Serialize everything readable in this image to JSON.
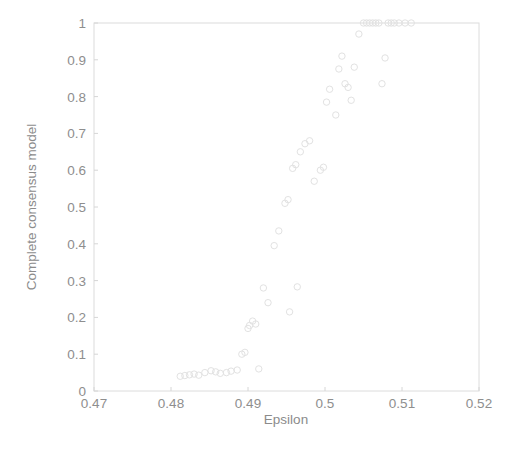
{
  "figure": {
    "background_color": "#ffffff",
    "axis_color": "#dcdcdc",
    "marker_color": "#e2e2e2",
    "text_color": "#8b8b8b"
  },
  "chart_data": {
    "type": "scatter",
    "title": "",
    "xlabel": "Epsilon",
    "ylabel": "Complete consensus model",
    "xlim": [
      0.47,
      0.52
    ],
    "ylim": [
      0,
      1
    ],
    "xticks": [
      0.47,
      0.48,
      0.49,
      0.5,
      0.51,
      0.52
    ],
    "xtick_labels": [
      "0.47",
      "0.48",
      "0.49",
      "0.5",
      "0.51",
      "0.52"
    ],
    "yticks": [
      0,
      0.1,
      0.2,
      0.3,
      0.4,
      0.5,
      0.6,
      0.7,
      0.8,
      0.9,
      1
    ],
    "ytick_labels": [
      "0",
      "0.1",
      "0.2",
      "0.3",
      "0.4",
      "0.5",
      "0.6",
      "0.7",
      "0.8",
      "0.9",
      "1"
    ],
    "grid": false,
    "legend": null,
    "marker": "circle-open",
    "marker_size": 4,
    "series": [
      {
        "name": "Complete consensus model",
        "points": [
          [
            0.4812,
            0.04
          ],
          [
            0.4818,
            0.042
          ],
          [
            0.4824,
            0.044
          ],
          [
            0.483,
            0.046
          ],
          [
            0.4836,
            0.043
          ],
          [
            0.4844,
            0.05
          ],
          [
            0.4852,
            0.055
          ],
          [
            0.4858,
            0.052
          ],
          [
            0.4864,
            0.048
          ],
          [
            0.4872,
            0.05
          ],
          [
            0.4878,
            0.054
          ],
          [
            0.4886,
            0.057
          ],
          [
            0.4892,
            0.1
          ],
          [
            0.4896,
            0.105
          ],
          [
            0.49,
            0.17
          ],
          [
            0.4902,
            0.178
          ],
          [
            0.4906,
            0.19
          ],
          [
            0.491,
            0.182
          ],
          [
            0.4914,
            0.06
          ],
          [
            0.492,
            0.28
          ],
          [
            0.4926,
            0.24
          ],
          [
            0.4934,
            0.395
          ],
          [
            0.494,
            0.435
          ],
          [
            0.4948,
            0.51
          ],
          [
            0.4952,
            0.52
          ],
          [
            0.4954,
            0.215
          ],
          [
            0.4958,
            0.605
          ],
          [
            0.4962,
            0.615
          ],
          [
            0.4964,
            0.283
          ],
          [
            0.4968,
            0.65
          ],
          [
            0.4974,
            0.672
          ],
          [
            0.498,
            0.68
          ],
          [
            0.4986,
            0.57
          ],
          [
            0.4994,
            0.6
          ],
          [
            0.4998,
            0.608
          ],
          [
            0.5002,
            0.785
          ],
          [
            0.5006,
            0.82
          ],
          [
            0.5014,
            0.75
          ],
          [
            0.5018,
            0.875
          ],
          [
            0.5022,
            0.91
          ],
          [
            0.5026,
            0.835
          ],
          [
            0.503,
            0.825
          ],
          [
            0.5034,
            0.79
          ],
          [
            0.5038,
            0.88
          ],
          [
            0.5044,
            0.97
          ],
          [
            0.505,
            1.0
          ],
          [
            0.5054,
            1.0
          ],
          [
            0.5058,
            1.0
          ],
          [
            0.5062,
            1.0
          ],
          [
            0.5066,
            1.0
          ],
          [
            0.507,
            1.0
          ],
          [
            0.5074,
            0.835
          ],
          [
            0.5078,
            0.905
          ],
          [
            0.5082,
            1.0
          ],
          [
            0.5086,
            1.0
          ],
          [
            0.509,
            1.0
          ],
          [
            0.5096,
            1.0
          ],
          [
            0.5104,
            1.0
          ],
          [
            0.5112,
            1.0
          ]
        ]
      }
    ]
  }
}
